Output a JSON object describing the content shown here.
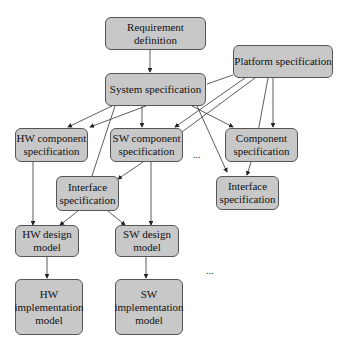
{
  "diagram": {
    "nodes": {
      "req_def": "Requirement definition",
      "sys_spec": "System specification",
      "platform_spec": "Platform specification",
      "hw_comp_spec": "HW component\nspecification",
      "sw_comp_spec": "SW component\nspecification",
      "comp_spec": "Component\nspecification",
      "iface_spec_left": "Interface\nspecification",
      "iface_spec_right": "Interface\nspecification",
      "hw_design": "HW design\nmodel",
      "sw_design": "SW design\nmodel",
      "hw_impl": "HW\nimplementation\nmodel",
      "sw_impl": "SW\nimplementation\nmodel"
    },
    "ellipses": [
      "...",
      "...",
      "..."
    ],
    "colors": {
      "node_fill": "#c8c8c8",
      "node_border": "#555555",
      "edge": "#333333"
    }
  }
}
